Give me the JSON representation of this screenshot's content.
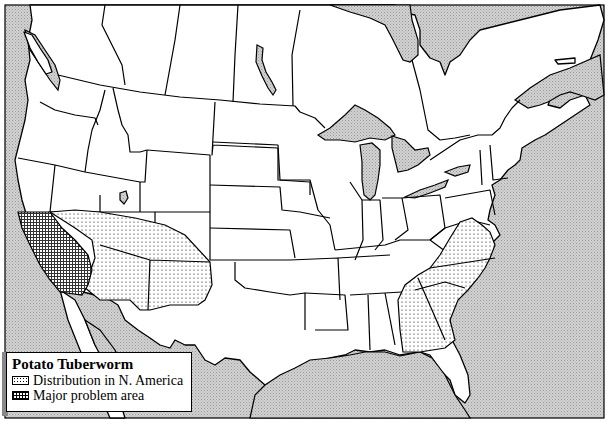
{
  "map": {
    "title": "Potato Tuberworm",
    "region": "North America (United States and southern Canada)",
    "colors": {
      "land": "#ffffff",
      "water": "#c8c8c8",
      "outline": "#000000"
    }
  },
  "legend": {
    "title": "Potato Tuberworm",
    "items": [
      {
        "label": "Distribution in N. America",
        "pattern": "dotted"
      },
      {
        "label": "Major problem area",
        "pattern": "grid"
      }
    ]
  },
  "regions": {
    "distribution": [
      "Arizona",
      "New Mexico",
      "Nevada (southern)",
      "Utah (southwest)",
      "Virginia",
      "North Carolina",
      "South Carolina",
      "Georgia"
    ],
    "major_problem": [
      "California"
    ]
  }
}
